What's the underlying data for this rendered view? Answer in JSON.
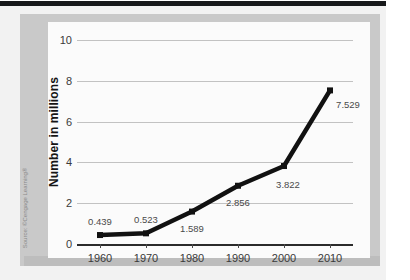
{
  "figure": {
    "source_credit": "Source: ©Cengage Learning®"
  },
  "chart_data": {
    "type": "line",
    "title": "",
    "xlabel": "",
    "ylabel": "Number in millions",
    "x": [
      1960,
      1970,
      1980,
      1990,
      2000,
      2010
    ],
    "categories": [
      "1960",
      "1970",
      "1980",
      "1990",
      "2000",
      "2010"
    ],
    "values": [
      0.439,
      0.523,
      1.589,
      2.856,
      3.822,
      7.529
    ],
    "point_labels": [
      "0.439",
      "0.523",
      "1.589",
      "2.856",
      "3.822",
      "7.529"
    ],
    "ylim": [
      0,
      10
    ],
    "yticks": [
      0,
      2,
      4,
      6,
      8,
      10
    ],
    "ytick_labels": [
      "0",
      "2",
      "4",
      "6",
      "8",
      "10"
    ],
    "xlim": [
      1955,
      2015
    ],
    "grid": true,
    "legend": "none",
    "series_color": "#111111",
    "marker": "square",
    "gridline_color": "#c2c2c2"
  }
}
